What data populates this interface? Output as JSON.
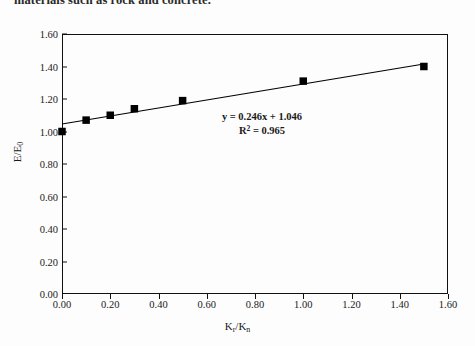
{
  "caption": {
    "text": "materials such as rock and concrete."
  },
  "chart_data": {
    "type": "scatter",
    "title": "",
    "xlabel": "Kr/Kn",
    "ylabel": "E/E0",
    "xlabel_parts": {
      "main1": "K",
      "sub1": "r",
      "slash": "/",
      "main2": "K",
      "sub2": "n"
    },
    "ylabel_parts": {
      "main1": "E",
      "slash": "/",
      "main2": "E",
      "sub2": "0"
    },
    "x": [
      0.0,
      0.1,
      0.2,
      0.3,
      0.5,
      1.0,
      1.5
    ],
    "values": [
      1.0,
      1.07,
      1.1,
      1.14,
      1.19,
      1.31,
      1.4
    ],
    "series": [
      {
        "name": "data",
        "x": [
          0.0,
          0.1,
          0.2,
          0.3,
          0.5,
          1.0,
          1.5
        ],
        "values": [
          1.0,
          1.07,
          1.1,
          1.14,
          1.19,
          1.31,
          1.4
        ],
        "marker": "square",
        "color": "#000000"
      },
      {
        "name": "trendline",
        "type": "line",
        "x": [
          0.0,
          1.5
        ],
        "values": [
          1.046,
          1.415
        ],
        "color": "#000000"
      }
    ],
    "xlim": [
      0.0,
      1.6
    ],
    "ylim": [
      0.0,
      1.6
    ],
    "xticks": [
      "0.00",
      "0.20",
      "0.40",
      "0.60",
      "0.80",
      "1.00",
      "1.20",
      "1.40",
      "1.60"
    ],
    "xtick_values": [
      0.0,
      0.2,
      0.4,
      0.6,
      0.8,
      1.0,
      1.2,
      1.4,
      1.6
    ],
    "yticks": [
      "0.00",
      "0.20",
      "0.40",
      "0.60",
      "0.80",
      "1.00",
      "1.20",
      "1.40",
      "1.60"
    ],
    "ytick_values": [
      0.0,
      0.2,
      0.4,
      0.6,
      0.8,
      1.0,
      1.2,
      1.4,
      1.6
    ],
    "grid": false,
    "legend": "none",
    "annotations": {
      "equation": "y = 0.246x + 1.046",
      "r_squared_label": "R",
      "r_squared_exp": "2",
      "r_squared_value": " = 0.965",
      "r_squared_full": "R2 = 0.965",
      "slope": 0.246,
      "intercept": 1.046,
      "r2": 0.965
    },
    "colors": {
      "axis": "#111111",
      "marker": "#000000",
      "line": "#000000",
      "background": "#ffffff"
    }
  }
}
